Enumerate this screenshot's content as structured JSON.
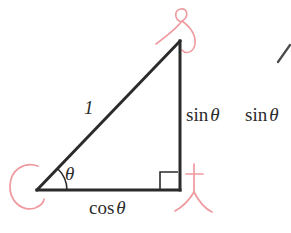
{
  "figure": {
    "kind": "right-triangle-unit-circle-diagram",
    "background_color": "#ffffff",
    "ink_color": "#2b2b2b",
    "annotation_color": "#ef9a9f",
    "clipped_top_text": "",
    "labels": {
      "hypotenuse": "1",
      "angle": "θ",
      "opposite": {
        "function": "sin",
        "argument": "θ"
      },
      "opposite_repeat": {
        "function": "sin",
        "argument": "θ"
      },
      "adjacent": {
        "function": "cos",
        "argument": "θ"
      }
    },
    "geometry": {
      "vertex_angle": [
        37,
        190
      ],
      "vertex_right_angle": [
        180,
        190
      ],
      "vertex_apex": [
        180,
        41
      ],
      "right_angle_marker": [
        160,
        170,
        15,
        15
      ],
      "angle_arc_radius": 30
    },
    "annotations": [
      {
        "name": "loop-mark-top",
        "color": "#ef9a9f"
      },
      {
        "name": "c-mark-left",
        "color": "#ef9a9f"
      },
      {
        "name": "t-mark-bottom-right",
        "color": "#ef9a9f"
      }
    ],
    "clipped_neighbor_stroke": {
      "name": "diagonal-fragment-right",
      "color": "#4a4a4a"
    }
  }
}
